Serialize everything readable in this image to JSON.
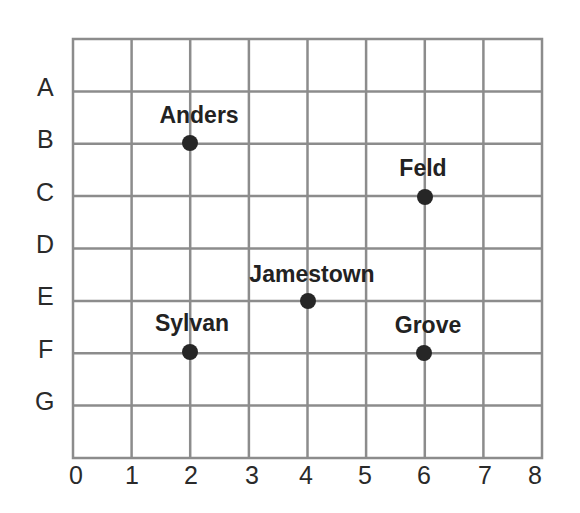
{
  "grid": {
    "columns": [
      "0",
      "1",
      "2",
      "3",
      "4",
      "5",
      "6",
      "7",
      "8"
    ],
    "rows": [
      "A",
      "B",
      "C",
      "D",
      "E",
      "F",
      "G"
    ],
    "line_color": "#8c8c8c",
    "point_color": "#262626"
  },
  "places": [
    {
      "name": "Anders",
      "col": 2,
      "row": "B"
    },
    {
      "name": "Feld",
      "col": 6,
      "row": "C"
    },
    {
      "name": "Jamestown",
      "col": 4,
      "row": "E"
    },
    {
      "name": "Sylvan",
      "col": 2,
      "row": "F"
    },
    {
      "name": "Grove",
      "col": 6,
      "row": "F"
    }
  ]
}
